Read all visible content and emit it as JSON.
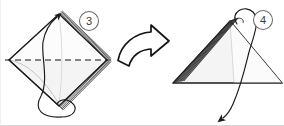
{
  "figure": {
    "background_color": "#ffffff",
    "ink_color": "#1a1a1a",
    "paper_fill": "#f2f2f2",
    "paper_fill_light": "#fafafa",
    "step_badge_color": "#3a3a3a"
  },
  "steps": [
    {
      "number": "3",
      "badge_label": "3",
      "shape_name": "diamond",
      "description": "Square rotated 45 degrees with horizontal dashed fold line through center and layered edges on the right side",
      "fold_line_style": "dashed",
      "fold_line_orientation": "horizontal",
      "layer_count": 5,
      "action_arrow": "curved-fold-up-arrow"
    },
    {
      "number": "4",
      "badge_label": "4",
      "shape_name": "triangle",
      "description": "Triangle with dense layered lines in the upper left region and a curved arrow looping from apex down to lower left",
      "fold_line_style": "none",
      "layer_count": 7,
      "action_arrow": "curved-unfold-down-arrow"
    }
  ],
  "transition": {
    "arrow_name": "curved-block-arrow",
    "direction": "right",
    "label": ""
  }
}
